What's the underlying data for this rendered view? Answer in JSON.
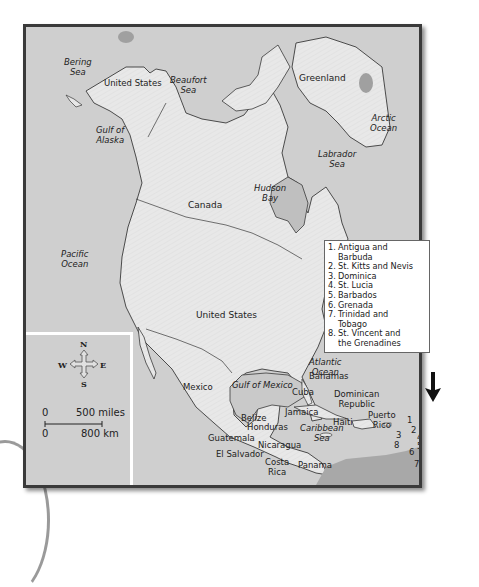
{
  "map": {
    "title": "North America",
    "countries": [
      {
        "name": "United States",
        "key": "alaska"
      },
      {
        "name": "Greenland"
      },
      {
        "name": "Canada"
      },
      {
        "name": "United States",
        "key": "contiguous"
      },
      {
        "name": "Mexico"
      },
      {
        "name": "Cuba"
      },
      {
        "name": "Bahamas"
      },
      {
        "name": "Dominican Republic"
      },
      {
        "name": "Jamaica"
      },
      {
        "name": "Haiti"
      },
      {
        "name": "Puerto Rico"
      },
      {
        "name": "Belize"
      },
      {
        "name": "Honduras"
      },
      {
        "name": "Guatemala"
      },
      {
        "name": "El Salvador"
      },
      {
        "name": "Nicaragua"
      },
      {
        "name": "Costa Rica"
      },
      {
        "name": "Panama"
      }
    ],
    "water_bodies": [
      {
        "name": "Bering Sea"
      },
      {
        "name": "Beaufort Sea"
      },
      {
        "name": "Gulf of Alaska"
      },
      {
        "name": "Arctic Ocean"
      },
      {
        "name": "Labrador Sea"
      },
      {
        "name": "Hudson Bay"
      },
      {
        "name": "Pacific Ocean"
      },
      {
        "name": "Atlantic Ocean"
      },
      {
        "name": "Gulf of Mexico"
      },
      {
        "name": "Caribbean Sea"
      }
    ],
    "labels": {
      "bering_sea_1": "Bering",
      "bering_sea_2": "Sea",
      "alaska_us": "United States",
      "beaufort_1": "Beaufort",
      "beaufort_2": "Sea",
      "gulf_alaska_1": "Gulf of",
      "gulf_alaska_2": "Alaska",
      "greenland": "Greenland",
      "arctic_1": "Arctic",
      "arctic_2": "Ocean",
      "labrador_1": "Labrador",
      "labrador_2": "Sea",
      "hudson_1": "Hudson",
      "hudson_2": "Bay",
      "canada": "Canada",
      "pacific_1": "Pacific",
      "pacific_2": "Ocean",
      "us": "United States",
      "atlantic_1": "Atlantic",
      "atlantic_2": "Ocean",
      "mexico": "Mexico",
      "gulf_mexico": "Gulf of Mexico",
      "bahamas": "Bahamas",
      "cuba": "Cuba",
      "dominican_1": "Dominican",
      "dominican_2": "Republic",
      "jamaica": "Jamaica",
      "haiti": "Haiti",
      "puerto_1": "Puerto",
      "puerto_2": "Rico",
      "belize": "Belize",
      "honduras": "Honduras",
      "caribbean_1": "Caribbean",
      "caribbean_2": "Sea",
      "guatemala": "Guatemala",
      "nicaragua": "Nicaragua",
      "el_salvador": "El Salvador",
      "costa_1": "Costa",
      "costa_2": "Rica",
      "panama": "Panama"
    },
    "island_numbers": [
      "1",
      "2",
      "3",
      "4",
      "5",
      "6",
      "7",
      "8"
    ],
    "legend": [
      {
        "num": "1.",
        "lines": [
          "Antigua and",
          "Barbuda"
        ]
      },
      {
        "num": "2.",
        "lines": [
          "St. Kitts and Nevis"
        ]
      },
      {
        "num": "3.",
        "lines": [
          "Dominica"
        ]
      },
      {
        "num": "4.",
        "lines": [
          "St. Lucia"
        ]
      },
      {
        "num": "5.",
        "lines": [
          "Barbados"
        ]
      },
      {
        "num": "6.",
        "lines": [
          "Grenada"
        ]
      },
      {
        "num": "7.",
        "lines": [
          "Trinidad and",
          "Tobago"
        ]
      },
      {
        "num": "8.",
        "lines": [
          "St. Vincent and",
          "the Grenadines"
        ]
      }
    ],
    "compass": {
      "n": "N",
      "s": "S",
      "e": "E",
      "w": "W"
    },
    "scale": {
      "miles_zero": "0",
      "miles_label": "500 miles",
      "km_zero": "0",
      "km_label": "800 km"
    },
    "colors": {
      "water": "#cfcfcf",
      "land": "#e6e6e6",
      "border": "#3a3a3a",
      "frame": "#3a3a3a",
      "lake": "#bdbdbd"
    }
  }
}
